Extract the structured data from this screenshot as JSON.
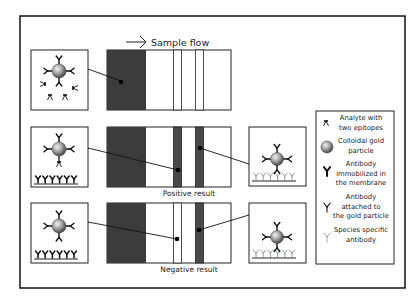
{
  "flow_label": "Sample flow",
  "results": {
    "positive": "Positive result",
    "negative": "Negative result"
  },
  "legend": {
    "items": [
      {
        "icon": "analyte-icon",
        "lines": [
          "Analyte with",
          "two epitopes"
        ]
      },
      {
        "icon": "gold-particle-icon",
        "lines": [
          "Colloidal gold",
          "particle"
        ]
      },
      {
        "icon": "immobilized-antibody-icon",
        "lines": [
          "Antibody",
          "immobilized in",
          "the membrane"
        ]
      },
      {
        "icon": "gold-antibody-icon",
        "lines": [
          "Antibody",
          "attached to",
          "the gold particle"
        ]
      },
      {
        "icon": "species-antibody-icon",
        "lines": [
          "Species specific",
          "antibody"
        ]
      }
    ]
  },
  "colors": {
    "pad": "#3c3c3c",
    "band": "#4a4a4a",
    "species_antibody": "#8a8f99",
    "gold": "#9a9a9a"
  }
}
